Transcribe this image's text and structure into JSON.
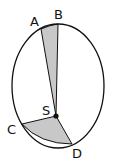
{
  "diagram": {
    "ellipse": {
      "cx": 58,
      "cy": 86,
      "rx": 46,
      "ry": 62,
      "stroke": "#111111"
    },
    "focus": {
      "label": "S",
      "x": 56,
      "y": 116
    },
    "points": {
      "A": {
        "label": "A",
        "x": 41,
        "y": 29
      },
      "B": {
        "label": "B",
        "x": 58,
        "y": 24
      },
      "C": {
        "label": "C",
        "x": 22,
        "y": 124
      },
      "D": {
        "label": "D",
        "x": 72,
        "y": 144
      }
    },
    "sectors": [
      {
        "name": "ASB",
        "fill": "#c8c8c8"
      },
      {
        "name": "CSD",
        "fill": "#c8c8c8"
      }
    ]
  }
}
